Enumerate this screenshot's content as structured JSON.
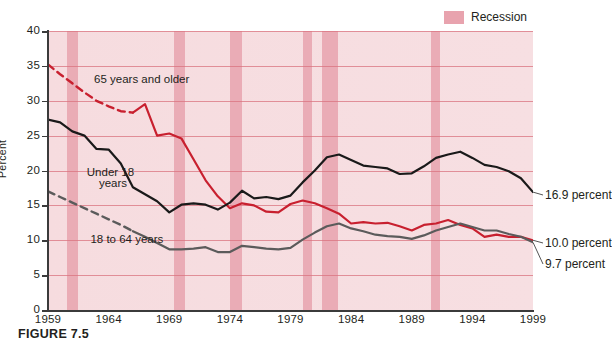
{
  "figure": {
    "caption": "FIGURE 7.5",
    "legend": {
      "label": "Recession",
      "swatch_color": "#e8a3ae"
    }
  },
  "chart_data": {
    "type": "line",
    "title": "",
    "xlabel": "",
    "ylabel": "Percent",
    "xlim": [
      1959,
      1999
    ],
    "ylim": [
      0,
      40
    ],
    "grid": true,
    "legend_position": "top-right",
    "x_ticks": [
      "1959",
      "1964",
      "1969",
      "1974",
      "1979",
      "1984",
      "1989",
      "1994",
      "1999"
    ],
    "y_ticks": [
      "0",
      "5",
      "10",
      "15",
      "20",
      "25",
      "30",
      "35",
      "40"
    ],
    "x": [
      1959,
      1960,
      1961,
      1962,
      1963,
      1964,
      1965,
      1966,
      1967,
      1968,
      1969,
      1970,
      1971,
      1972,
      1973,
      1974,
      1975,
      1976,
      1977,
      1978,
      1979,
      1980,
      1981,
      1982,
      1983,
      1984,
      1985,
      1986,
      1987,
      1988,
      1989,
      1990,
      1991,
      1992,
      1993,
      1994,
      1995,
      1996,
      1997,
      1998,
      1999
    ],
    "series": [
      {
        "name": "65 years and older",
        "color": "#c8202f",
        "style": "solid-with-dashed-lead",
        "dashed_until": 1966,
        "end_label": "10.0 percent",
        "values": [
          35.2,
          33.8,
          32.5,
          31.2,
          30.0,
          29.2,
          28.5,
          28.3,
          29.5,
          25.0,
          25.3,
          24.6,
          21.6,
          18.6,
          16.3,
          14.6,
          15.3,
          15.0,
          14.1,
          14.0,
          15.2,
          15.7,
          15.3,
          14.6,
          13.8,
          12.4,
          12.6,
          12.4,
          12.5,
          12.0,
          11.4,
          12.2,
          12.4,
          12.9,
          12.2,
          11.7,
          10.5,
          10.8,
          10.5,
          10.5,
          10.0
        ]
      },
      {
        "name": "Under 18 years",
        "color": "#1a1a1a",
        "style": "solid",
        "end_label": "16.9 percent",
        "values": [
          27.3,
          26.9,
          25.6,
          25.0,
          23.1,
          23.0,
          21.0,
          17.6,
          16.6,
          15.6,
          14.0,
          15.1,
          15.3,
          15.1,
          14.4,
          15.4,
          17.1,
          16.0,
          16.2,
          15.9,
          16.4,
          18.3,
          20.0,
          21.9,
          22.3,
          21.5,
          20.7,
          20.5,
          20.3,
          19.5,
          19.6,
          20.6,
          21.8,
          22.3,
          22.7,
          21.8,
          20.8,
          20.5,
          19.9,
          18.9,
          16.9
        ]
      },
      {
        "name": "18 to 64 years",
        "color": "#5b5b5b",
        "style": "solid-with-dashed-lead",
        "dashed_until": 1966,
        "end_label": "9.7 percent",
        "values": [
          17.0,
          16.2,
          15.4,
          14.6,
          13.8,
          13.0,
          12.2,
          11.3,
          10.5,
          9.6,
          8.7,
          8.7,
          8.8,
          9.0,
          8.3,
          8.3,
          9.2,
          9.0,
          8.8,
          8.7,
          8.9,
          10.1,
          11.1,
          12.0,
          12.4,
          11.7,
          11.3,
          10.8,
          10.6,
          10.5,
          10.2,
          10.7,
          11.4,
          11.9,
          12.4,
          11.9,
          11.4,
          11.4,
          10.9,
          10.5,
          9.7
        ]
      }
    ],
    "recession_bands": [
      {
        "start": 1960.6,
        "end": 1961.5
      },
      {
        "start": 1969.4,
        "end": 1970.3
      },
      {
        "start": 1974.0,
        "end": 1975.0
      },
      {
        "start": 1980.0,
        "end": 1980.8
      },
      {
        "start": 1981.6,
        "end": 1982.9
      },
      {
        "start": 1990.6,
        "end": 1991.3
      }
    ],
    "annotations": [
      {
        "text": "65 years and older",
        "x": 1962.8,
        "y": 33.0
      },
      {
        "text": "Under 18",
        "x": 1962.2,
        "y": 19.6
      },
      {
        "text": "years",
        "x": 1963.2,
        "y": 18.0
      },
      {
        "text": "18 to 64 years",
        "x": 1962.5,
        "y": 10.1
      }
    ]
  }
}
